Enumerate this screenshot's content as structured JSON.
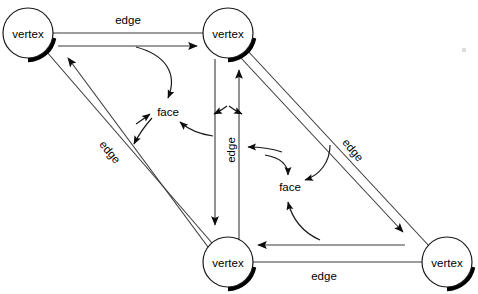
{
  "diagram": {
    "background_color": "#ffffff",
    "line_color": "#3a3a3a",
    "arrow_color": "#1a1a1a",
    "node_fill": "#ffffff",
    "node_stroke": "#1a1a1a",
    "nodes": [
      {
        "id": "v_tl",
        "label": "vertex",
        "cx": 28,
        "cy": 33,
        "r": 25
      },
      {
        "id": "v_tr",
        "label": "vertex",
        "cx": 228,
        "cy": 33,
        "r": 25
      },
      {
        "id": "v_bc",
        "label": "vertex",
        "cx": 228,
        "cy": 262,
        "r": 25
      },
      {
        "id": "v_br",
        "label": "vertex",
        "cx": 447,
        "cy": 262,
        "r": 25
      }
    ],
    "face_labels": [
      {
        "id": "face_top",
        "label": "face",
        "x": 168,
        "y": 112
      },
      {
        "id": "face_bottom",
        "label": "face",
        "x": 290,
        "y": 187
      }
    ],
    "edge_labels": [
      {
        "id": "edge_top",
        "label": "edge",
        "x": 128,
        "y": 20,
        "rotation": 0
      },
      {
        "id": "edge_left",
        "label": "edge",
        "x": 110,
        "y": 152,
        "rotation": 50
      },
      {
        "id": "edge_center",
        "label": "edge",
        "x": 231,
        "y": 150,
        "rotation": -90
      },
      {
        "id": "edge_right",
        "label": "edge",
        "x": 353,
        "y": 150,
        "rotation": 50
      },
      {
        "id": "edge_bottom",
        "label": "edge",
        "x": 324,
        "y": 276,
        "rotation": 0
      }
    ]
  }
}
